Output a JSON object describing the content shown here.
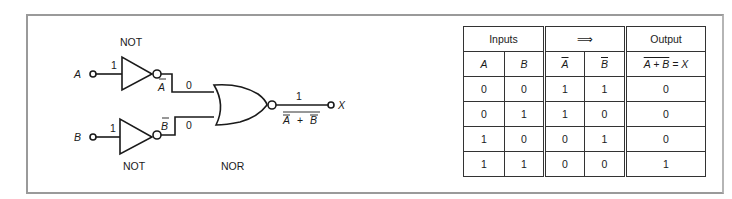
{
  "diagram": {
    "gates": [
      {
        "id": "not-a",
        "type": "NOT",
        "label": "NOT"
      },
      {
        "id": "not-b",
        "type": "NOT",
        "label": "NOT"
      },
      {
        "id": "nor",
        "type": "NOR",
        "label": "NOR"
      }
    ],
    "inputs": {
      "a": "A",
      "b": "B"
    },
    "input_values": {
      "a": "1",
      "b": "1"
    },
    "inverted_labels": {
      "a": "A",
      "b": "B"
    },
    "inverted_values": {
      "a": "0",
      "b": "0"
    },
    "output": {
      "label": "X",
      "value": "1",
      "expression_a": "A",
      "plus": "+",
      "expression_b": "B"
    }
  },
  "truth_table": {
    "group_headers": [
      "Inputs",
      "⟹",
      "Output"
    ],
    "columns": [
      "A",
      "B",
      "A",
      "B",
      "A + B",
      "= X"
    ],
    "rows": [
      [
        "0",
        "0",
        "1",
        "1",
        "0"
      ],
      [
        "0",
        "1",
        "1",
        "0",
        "0"
      ],
      [
        "1",
        "0",
        "0",
        "1",
        "0"
      ],
      [
        "1",
        "1",
        "0",
        "0",
        "1"
      ]
    ]
  }
}
